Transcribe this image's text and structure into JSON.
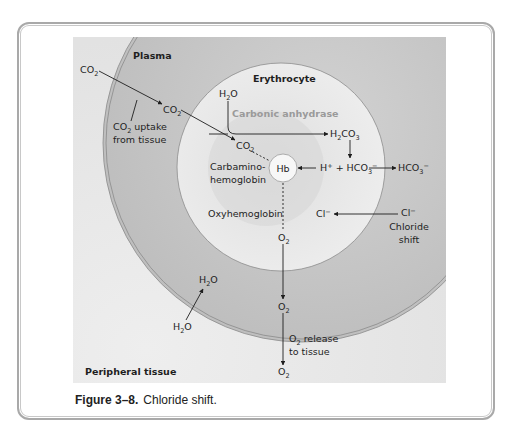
{
  "figure": {
    "caption_number": "Figure 3–8.",
    "caption_text": "Chloride shift.",
    "regions": {
      "plasma": "Plasma",
      "erythrocyte": "Erythrocyte",
      "peripheral_tissue": "Peripheral tissue"
    },
    "labels": {
      "co2_tissue": "CO",
      "co2_plasma": "CO",
      "co2_cell": "CO",
      "co2_uptake_1": "CO",
      "co2_uptake_1b": " uptake",
      "co2_uptake_2": "from tissue",
      "h2o_cell": "H",
      "h2o_cell_b": "O",
      "carbonic_anhydrase": "Carbonic anhydrase",
      "h2co3_a": "H",
      "h2co3_b": "CO",
      "carbamino_1": "Carbamino-",
      "carbamino_2": "hemoglobin",
      "hb": "Hb",
      "h_plus": "H",
      "plus": " + HCO",
      "hco3_out": "HCO",
      "oxyhemoglobin": "Oxyhemoglobin",
      "cl_in": "Cl",
      "cl_out": "Cl",
      "chloride_1": "Chloride",
      "chloride_2": "shift",
      "o2": "O",
      "o2_release_1b": " release",
      "o2_release_2": "to tissue",
      "h2o_plasma": "H",
      "h2o_tissue": "H",
      "h2o_o": "O",
      "sub2": "2",
      "sub3": "3",
      "sup_minus": "−",
      "sup_plus": "+"
    },
    "colors": {
      "panel": "#dcdcdc",
      "plasma_ring": "#c4c4c4",
      "erythrocyte": "#e6e6e6",
      "inner_shade": "#cfcfcf",
      "enzyme_text": "#9a9a9a",
      "frame_border": "#a9a9a9"
    }
  }
}
